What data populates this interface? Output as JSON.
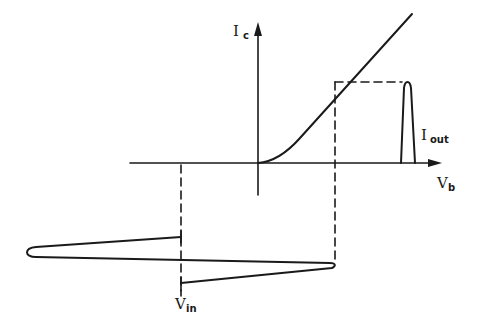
{
  "diagram": {
    "colors": {
      "stroke": "#1a1a1a",
      "background": "#ffffff"
    },
    "axes": {
      "vertical": {
        "label_main": "I",
        "label_sub": "c"
      },
      "horizontal": {
        "label_main": "V",
        "label_sub": "b"
      }
    },
    "labels": {
      "output": {
        "main": "I",
        "sub": "out"
      },
      "input": {
        "main": "V",
        "sub": "in"
      }
    },
    "elements": [
      "Ic vs Vb transfer curve (knee at origin, then linear)",
      "output current pulse Iout",
      "input voltage pulse Vin (drawn along negative-down time axis)",
      "dashed projection lines"
    ]
  }
}
